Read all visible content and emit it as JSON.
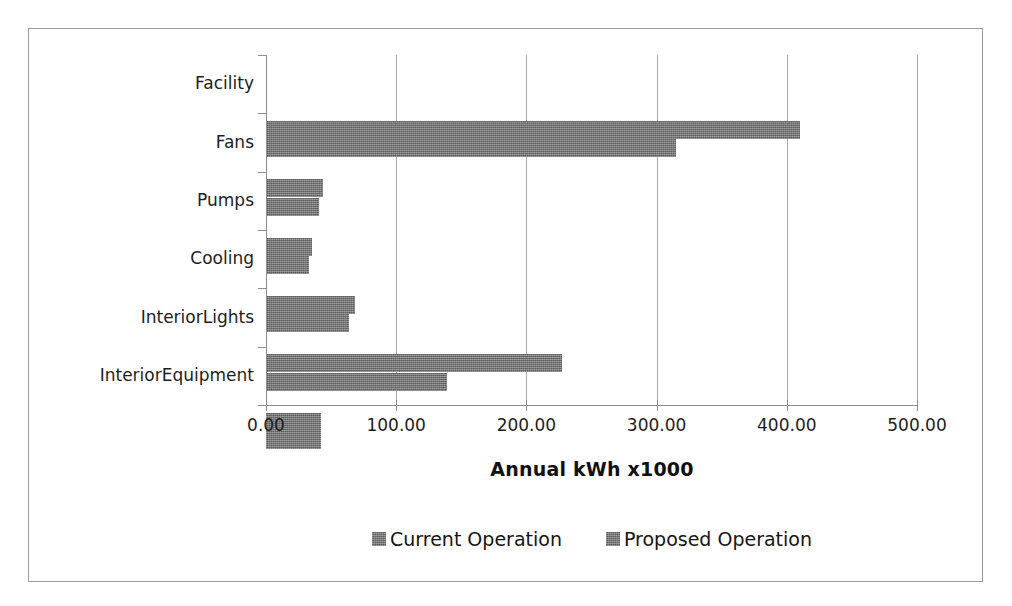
{
  "chart_data": {
    "type": "bar",
    "orientation": "horizontal",
    "title": "",
    "xlabel": "Annual kWh x1000",
    "ylabel": "",
    "xlim": [
      0,
      500
    ],
    "xticks": [
      "0.00",
      "100.00",
      "200.00",
      "300.00",
      "400.00",
      "500.00"
    ],
    "xtick_values": [
      0,
      100,
      200,
      300,
      400,
      500
    ],
    "grid": "vertical",
    "legend_position": "bottom",
    "categories": [
      "Facility",
      "Fans",
      "Pumps",
      "Cooling",
      "InteriorLights",
      "InteriorEquipment"
    ],
    "series": [
      {
        "name": "Current Operation",
        "color": "#7d7d7d",
        "values": [
          410.0,
          44.0,
          35.0,
          68.0,
          227.0,
          42.0
        ]
      },
      {
        "name": "Proposed Operation",
        "color": "#7d7d7d",
        "values": [
          315.0,
          41.0,
          33.0,
          64.0,
          139.0,
          42.0
        ]
      }
    ]
  },
  "axis": {
    "value_axis_title": "Annual kWh x1000"
  },
  "legend": {
    "entries": [
      {
        "label": "Current Operation",
        "swatch": "legend-swatch-icon"
      },
      {
        "label": "Proposed Operation",
        "swatch": "legend-swatch-icon"
      }
    ]
  }
}
